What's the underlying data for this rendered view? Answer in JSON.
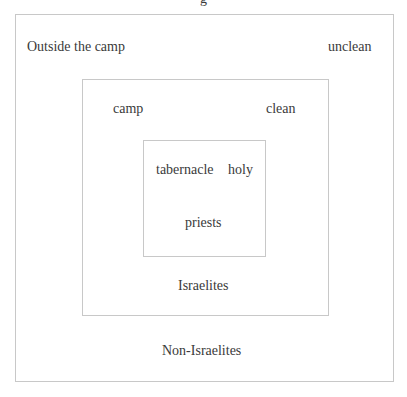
{
  "diagram": {
    "title_fragment": "g",
    "outer": {
      "label_left": "Outside the camp",
      "label_right": "unclean",
      "label_bottom": "Non-Israelites"
    },
    "middle": {
      "label_left": "camp",
      "label_right": "clean",
      "label_bottom": "Israelites"
    },
    "inner": {
      "label_left": "tabernacle",
      "label_right": "holy",
      "label_bottom": "priests"
    },
    "colors": {
      "border": "#c8c8c8",
      "text": "#3a3a3a",
      "background": "#ffffff"
    }
  }
}
